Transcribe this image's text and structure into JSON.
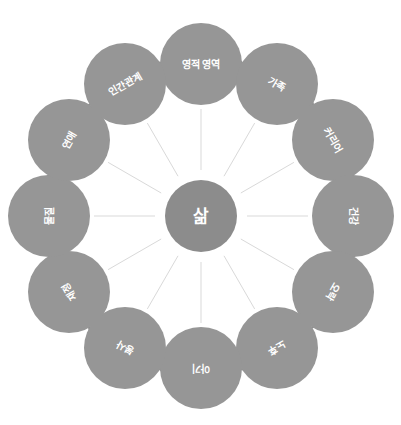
{
  "diagram": {
    "title": "삶",
    "type": "radial-wheel",
    "center": {
      "label": "삶",
      "radius": 36,
      "cx": 201,
      "cy": 216,
      "color": "#8c8c8c"
    },
    "style": {
      "background": "#ffffff",
      "node_color": "#969696",
      "center_color": "#8c8c8c",
      "spoke_color": "#d9d9d9",
      "label_color": "#ffffff",
      "arrow_color": "#8a8a8a"
    },
    "ring": {
      "ring_radius": 152,
      "node_radius": 41,
      "node_count": 12
    },
    "nodes": [
      {
        "id": "node-1",
        "label": "영적 영역",
        "angle": -90,
        "rotation": 0,
        "cx": 201,
        "cy": 64
      },
      {
        "id": "node-2",
        "label": "가족",
        "angle": -60,
        "rotation": 30,
        "cx": 277,
        "cy": 84
      },
      {
        "id": "node-3",
        "label": "커리어",
        "angle": -30,
        "rotation": 60,
        "cx": 333,
        "cy": 140
      },
      {
        "id": "node-4",
        "label": "건강",
        "angle": 0,
        "rotation": 90,
        "cx": 353,
        "cy": 216
      },
      {
        "id": "node-5",
        "label": "오락",
        "angle": 30,
        "rotation": 120,
        "cx": 333,
        "cy": 292
      },
      {
        "id": "node-6",
        "label": "노후",
        "angle": 60,
        "rotation": 150,
        "cx": 277,
        "cy": 348
      },
      {
        "id": "node-7",
        "label": "아기",
        "angle": 90,
        "rotation": 180,
        "cx": 201,
        "cy": 368
      },
      {
        "id": "node-8",
        "label": "봉사",
        "angle": 120,
        "rotation": 210,
        "cx": 125,
        "cy": 348
      },
      {
        "id": "node-9",
        "label": "재정",
        "angle": 150,
        "rotation": 240,
        "cx": 69,
        "cy": 292
      },
      {
        "id": "node-10",
        "label": "물질",
        "angle": 180,
        "rotation": 270,
        "cx": 49,
        "cy": 216
      },
      {
        "id": "node-11",
        "label": "연애",
        "angle": 210,
        "rotation": 300,
        "cx": 69,
        "cy": 140
      },
      {
        "id": "node-12",
        "label": "인간관계",
        "angle": 240,
        "rotation": 330,
        "cx": 125,
        "cy": 84
      }
    ],
    "arrows": [
      {
        "id": "arrow-1",
        "between": [
          "node-1",
          "node-2"
        ],
        "x": 242,
        "y": 63
      },
      {
        "id": "arrow-2",
        "between": [
          "node-2",
          "node-3"
        ],
        "x": 313,
        "y": 105
      },
      {
        "id": "arrow-3",
        "between": [
          "node-3",
          "node-4"
        ],
        "x": 353,
        "y": 175
      },
      {
        "id": "arrow-4",
        "between": [
          "node-4",
          "node-5"
        ],
        "x": 353,
        "y": 257
      },
      {
        "id": "arrow-5",
        "between": [
          "node-5",
          "node-6"
        ],
        "x": 313,
        "y": 327
      },
      {
        "id": "arrow-6",
        "between": [
          "node-6",
          "node-7"
        ],
        "x": 242,
        "y": 369
      },
      {
        "id": "arrow-7",
        "between": [
          "node-7",
          "node-8"
        ],
        "x": 160,
        "y": 369
      },
      {
        "id": "arrow-8",
        "between": [
          "node-8",
          "node-9"
        ],
        "x": 89,
        "y": 327
      },
      {
        "id": "arrow-9",
        "between": [
          "node-9",
          "node-10"
        ],
        "x": 49,
        "y": 257
      },
      {
        "id": "arrow-10",
        "between": [
          "node-10",
          "node-11"
        ],
        "x": 49,
        "y": 175
      },
      {
        "id": "arrow-11",
        "between": [
          "node-11",
          "node-12"
        ],
        "x": 89,
        "y": 105
      },
      {
        "id": "arrow-12",
        "between": [
          "node-12",
          "node-1"
        ],
        "x": 160,
        "y": 63
      }
    ]
  }
}
